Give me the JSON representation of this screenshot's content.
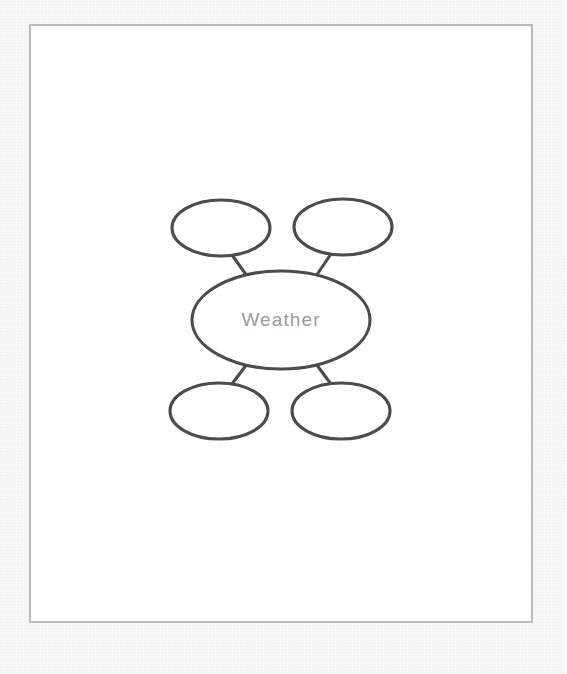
{
  "page": {
    "background_color": "#f8f8f8",
    "sheet_color": "#ffffff",
    "border_color": "#b9bbbe"
  },
  "diagram": {
    "type": "bubble-map",
    "stroke_color": "#4c4c4c",
    "fill_color": "#ffffff",
    "label_color": "#9b9b9b",
    "center": {
      "id": "center-bubble",
      "label": "Weather",
      "cx": 281,
      "cy": 320,
      "rx": 89,
      "ry": 49
    },
    "satellites": [
      {
        "id": "bubble-top-left",
        "label": "",
        "cx": 221,
        "cy": 228,
        "rx": 49,
        "ry": 28
      },
      {
        "id": "bubble-top-right",
        "label": "",
        "cx": 343,
        "cy": 227,
        "rx": 49,
        "ry": 28
      },
      {
        "id": "bubble-bottom-left",
        "label": "",
        "cx": 219,
        "cy": 411,
        "rx": 49,
        "ry": 28
      },
      {
        "id": "bubble-bottom-right",
        "label": "",
        "cx": 341,
        "cy": 411,
        "rx": 49,
        "ry": 28
      }
    ],
    "connectors": [
      {
        "id": "connector-top-left",
        "x1": 232,
        "y1": 255,
        "x2": 247,
        "y2": 276
      },
      {
        "id": "connector-top-right",
        "x1": 331,
        "y1": 254,
        "x2": 316,
        "y2": 276
      },
      {
        "id": "connector-bottom-left",
        "x1": 247,
        "y1": 364,
        "x2": 232,
        "y2": 384
      },
      {
        "id": "connector-bottom-right",
        "x1": 316,
        "y1": 364,
        "x2": 331,
        "y2": 384
      }
    ]
  }
}
